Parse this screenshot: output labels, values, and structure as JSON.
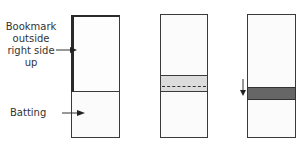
{
  "labels": {
    "bookmark": [
      "Bookmark",
      "outside",
      "right side",
      "up"
    ],
    "batting": "Batting"
  },
  "colors": {
    "outline": "#3a3a3a",
    "fabric": "#fbfbfb",
    "band_light": "#dcdcdc",
    "band_dark": "#666666"
  }
}
